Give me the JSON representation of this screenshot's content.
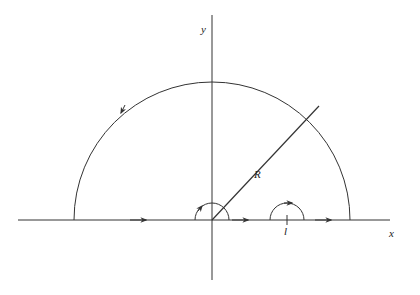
{
  "diagram": {
    "type": "contour-integration",
    "labels": {
      "y_axis": "y",
      "x_axis": "x",
      "radius": "R",
      "point": "l"
    },
    "stroke_color": "#333333",
    "background": "#ffffff"
  }
}
